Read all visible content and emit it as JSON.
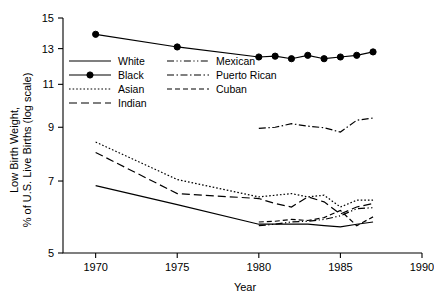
{
  "chart_data": {
    "type": "line",
    "title": "",
    "xlabel": "Year",
    "ylabel": "Low Birth Weight, % of U.S. Live Births (log scale)",
    "ylabel_line1": "Low Birth Weight,",
    "ylabel_line2": "% of U.S. Live Births (log scale)",
    "yscale": "log",
    "xlim": [
      1968,
      1990
    ],
    "ylim": [
      5,
      15
    ],
    "xticks": [
      1970,
      1975,
      1980,
      1985,
      1990
    ],
    "xtick_labels": [
      "1970",
      "1975",
      "1980",
      "1985",
      "1990"
    ],
    "yticks": [
      5,
      7,
      9,
      11,
      13,
      15
    ],
    "ytick_labels": [
      "5",
      "7",
      "9",
      "11",
      "13",
      "15"
    ],
    "grid": false,
    "legend_position": "upper-left-inside",
    "series": [
      {
        "name": "White",
        "label": "White",
        "style": "solid",
        "dash": "none",
        "marker": "none",
        "color": "#000000",
        "x": [
          1970,
          1975,
          1980,
          1981,
          1982,
          1983,
          1984,
          1985,
          1986,
          1987
        ],
        "values": [
          6.85,
          6.27,
          5.72,
          5.72,
          5.72,
          5.72,
          5.68,
          5.65,
          5.72,
          5.78
        ]
      },
      {
        "name": "Black",
        "label": "Black",
        "style": "solid-marker",
        "dash": "none",
        "marker": "circle",
        "color": "#000000",
        "x": [
          1970,
          1975,
          1980,
          1981,
          1982,
          1983,
          1984,
          1985,
          1986,
          1987
        ],
        "values": [
          13.9,
          13.1,
          12.5,
          12.55,
          12.4,
          12.6,
          12.4,
          12.5,
          12.6,
          12.8
        ]
      },
      {
        "name": "Asian",
        "label": "Asian",
        "style": "dotted",
        "dash": "1.6 2",
        "marker": "none",
        "color": "#000000",
        "x": [
          1970,
          1975,
          1980,
          1981,
          1982,
          1983,
          1984,
          1985,
          1986,
          1987
        ],
        "values": [
          8.4,
          7.05,
          6.5,
          6.55,
          6.6,
          6.5,
          6.55,
          6.2,
          6.4,
          6.4
        ]
      },
      {
        "name": "Indian",
        "label": "Indian",
        "style": "long-dash",
        "dash": "8 4",
        "marker": "none",
        "color": "#000000",
        "x": [
          1970,
          1975,
          1980,
          1981,
          1982,
          1983,
          1984,
          1985,
          1986,
          1987
        ],
        "values": [
          8.0,
          6.6,
          6.45,
          6.3,
          6.2,
          6.5,
          6.35,
          6.0,
          6.2,
          6.3
        ]
      },
      {
        "name": "Mexican",
        "label": "Mexican",
        "style": "dash-dot-dot",
        "dash": "7 2.5 1.2 2.5 1.2 2.5",
        "marker": "none",
        "color": "#000000",
        "x": [
          1980,
          1981,
          1982,
          1983,
          1984,
          1985,
          1986,
          1987
        ],
        "values": [
          5.68,
          5.72,
          5.78,
          5.8,
          5.85,
          5.95,
          6.15,
          6.18
        ]
      },
      {
        "name": "Puerto Rican",
        "label": "Puerto Rican",
        "style": "dash-dot",
        "dash": "7 2.5 1.5 2.5",
        "marker": "none",
        "color": "#000000",
        "x": [
          1980,
          1981,
          1982,
          1983,
          1984,
          1985,
          1986,
          1987
        ],
        "values": [
          8.95,
          9.0,
          9.15,
          9.05,
          8.98,
          8.8,
          9.3,
          9.4
        ]
      },
      {
        "name": "Cuban",
        "label": "Cuban",
        "style": "dashed",
        "dash": "5 3",
        "marker": "none",
        "color": "#000000",
        "x": [
          1980,
          1981,
          1982,
          1983,
          1984,
          1985,
          1986,
          1987
        ],
        "values": [
          5.78,
          5.8,
          5.85,
          5.82,
          5.9,
          6.1,
          5.68,
          5.92
        ]
      }
    ],
    "legend": [
      {
        "label": "White",
        "style": "solid",
        "marker": "none",
        "column": 0
      },
      {
        "label": "Black",
        "style": "solid-marker",
        "marker": "circle",
        "column": 0
      },
      {
        "label": "Asian",
        "style": "dotted",
        "marker": "none",
        "column": 0
      },
      {
        "label": "Indian",
        "style": "long-dash",
        "marker": "none",
        "column": 0
      },
      {
        "label": "Mexican",
        "style": "dash-dot-dot",
        "marker": "none",
        "column": 1
      },
      {
        "label": "Puerto Rican",
        "style": "dash-dot",
        "marker": "none",
        "column": 1
      },
      {
        "label": "Cuban",
        "style": "dashed",
        "marker": "none",
        "column": 1
      }
    ]
  }
}
